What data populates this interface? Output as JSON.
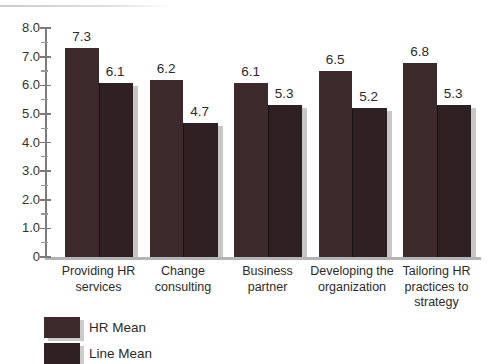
{
  "figure": {
    "background": "#ffffff",
    "text_color": "#2b2b2b",
    "axis_color": "#7b7b7b",
    "baseline_color": "#b4b4b4",
    "shadow_color": "#c7c7c7"
  },
  "chart_data": {
    "type": "bar",
    "title": "",
    "xlabel": "",
    "ylabel": "",
    "categories": [
      "Providing HR\nservices",
      "Change\nconsulting",
      "Business\npartner",
      "Developing the\norganization",
      "Tailoring HR\npractices to\nstrategy"
    ],
    "series": [
      {
        "name": "HR Mean",
        "color": "#3d2a2c",
        "values": [
          7.3,
          6.2,
          6.1,
          6.5,
          6.8
        ]
      },
      {
        "name": "Line Mean",
        "color": "#2f2023",
        "values": [
          6.1,
          4.7,
          5.3,
          5.2,
          5.3
        ]
      }
    ],
    "ylim": [
      0,
      8
    ],
    "ytick_step": 1,
    "ytick_minor_step": 0.5,
    "ytick_labels": [
      "0",
      "1.0",
      "2.0",
      "3.0",
      "4.0",
      "5.0",
      "6.0",
      "7.0",
      "8.0"
    ],
    "value_label_decimals": 1,
    "grid": false,
    "legend_position": "bottom-left"
  }
}
